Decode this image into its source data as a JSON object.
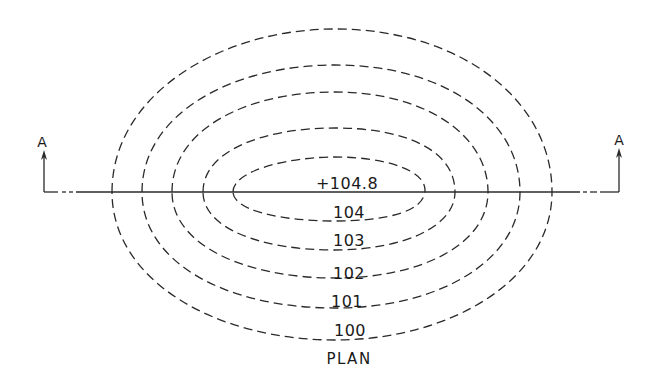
{
  "diagram": {
    "type": "topographic contour plan",
    "title": "PLAN",
    "section_marker": {
      "left_label": "A",
      "right_label": "A"
    },
    "summit_label": "+104.8",
    "contours": [
      {
        "label": "104",
        "cx": 329,
        "cy": 190,
        "rx": 96,
        "ry": 33
      },
      {
        "label": "103",
        "cx": 329,
        "cy": 189,
        "rx": 126,
        "ry": 61
      },
      {
        "label": "102",
        "cx": 330,
        "cy": 185,
        "rx": 158,
        "ry": 93
      },
      {
        "label": "101",
        "cx": 331,
        "cy": 186,
        "rx": 189,
        "ry": 121
      },
      {
        "label": "100",
        "cx": 332,
        "cy": 184,
        "rx": 220,
        "ry": 156
      }
    ],
    "labels": {
      "summit": "+104.8",
      "c104": "104",
      "c103": "103",
      "c102": "102",
      "c101": "101",
      "c100": "100",
      "plan": "PLAN",
      "section_left": "A",
      "section_right": "A"
    },
    "colors": {
      "ink": "#2a2a2a",
      "background": "#ffffff"
    }
  }
}
